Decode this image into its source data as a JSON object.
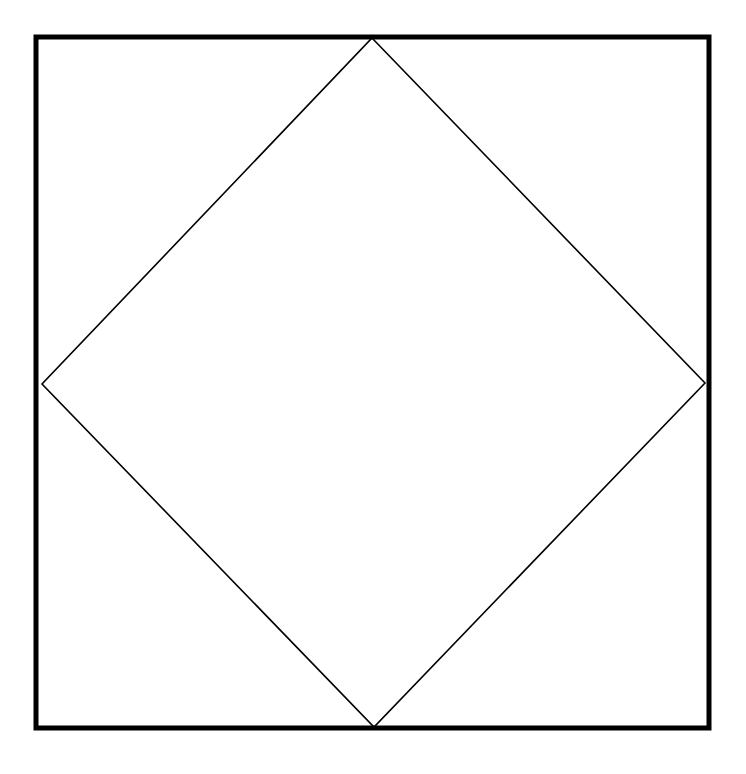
{
  "diagram": {
    "type": "geometric-figure",
    "canvas": {
      "width": 746,
      "height": 774,
      "background": "#ffffff"
    },
    "outer_square": {
      "points": [
        [
          36,
          37
        ],
        [
          709,
          37
        ],
        [
          709,
          728
        ],
        [
          36,
          728
        ]
      ],
      "stroke": "#000000",
      "stroke_width": 5
    },
    "inner_diamond": {
      "vertices": {
        "top": [
          372,
          38
        ],
        "right": [
          705,
          383
        ],
        "bottom": [
          374,
          727
        ],
        "left": [
          42,
          384
        ]
      },
      "stroke": "#000000",
      "stroke_width": 1.6
    }
  }
}
